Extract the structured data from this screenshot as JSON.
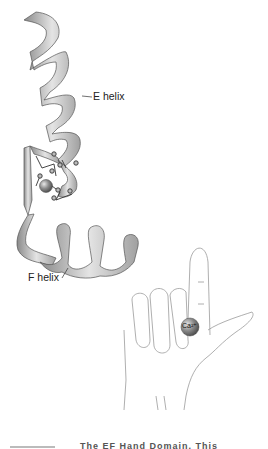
{
  "figure": {
    "labels": {
      "e_helix": "E helix",
      "f_helix": "F helix",
      "ion": "Ca²⁺"
    },
    "caption": "The EF Hand Domain. This",
    "colors": {
      "ribbon_light": "#e4e4e4",
      "ribbon_mid": "#b8b8b8",
      "ribbon_dark": "#8a8a8a",
      "outline": "#555555",
      "ion": "#7a7a7a",
      "hand_line": "#9a9a9a"
    }
  }
}
